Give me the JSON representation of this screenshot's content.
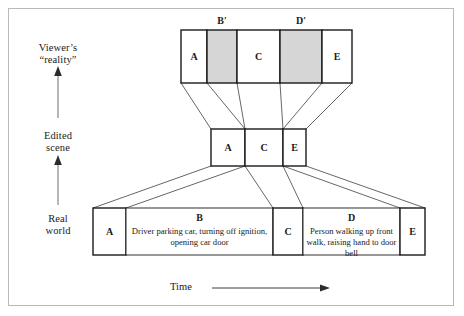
{
  "figure": {
    "background_color": "#ffffff",
    "frame_color": "#b9b9b9",
    "box_stroke": "#1a1a1a",
    "connector_stroke": "#4a4a4a",
    "shaded_fill": "#d6d6d6",
    "plain_fill": "#ffffff"
  },
  "axis": {
    "vertical": {
      "levels": [
        {
          "id": "viewers-reality",
          "line1": "Viewer’s",
          "line2": "“reality”"
        },
        {
          "id": "edited-scene",
          "line1": "Edited",
          "line2": "scene"
        },
        {
          "id": "real-world",
          "line1": "Real",
          "line2": "world"
        }
      ],
      "arrow_direction": "up",
      "arrow_count": 2
    },
    "horizontal": {
      "label": "Time",
      "arrow_direction": "right"
    }
  },
  "rows": {
    "viewers_reality": {
      "name": "Viewer’s reality",
      "segments": [
        {
          "id": "vr-a",
          "label": "A",
          "top_label": "",
          "shaded": false,
          "x": 181,
          "width": 26
        },
        {
          "id": "vr-bprime",
          "label": "",
          "top_label": "B′",
          "shaded": true,
          "x": 207,
          "width": 30
        },
        {
          "id": "vr-c",
          "label": "C",
          "top_label": "",
          "shaded": false,
          "x": 237,
          "width": 43
        },
        {
          "id": "vr-dprime",
          "label": "",
          "top_label": "D′",
          "shaded": true,
          "x": 280,
          "width": 42
        },
        {
          "id": "vr-e",
          "label": "E",
          "top_label": "",
          "shaded": false,
          "x": 322,
          "width": 30
        }
      ]
    },
    "edited_scene": {
      "name": "Edited scene",
      "segments": [
        {
          "id": "es-a",
          "label": "A",
          "shaded": false,
          "x": 211,
          "width": 34
        },
        {
          "id": "es-c",
          "label": "C",
          "shaded": false,
          "x": 245,
          "width": 38
        },
        {
          "id": "es-e",
          "label": "E",
          "shaded": false,
          "x": 283,
          "width": 23
        }
      ]
    },
    "real_world": {
      "name": "Real world",
      "segments": [
        {
          "id": "rw-a",
          "label": "A",
          "title": "",
          "desc": "",
          "x": 93,
          "width": 33
        },
        {
          "id": "rw-b",
          "label": "",
          "title": "B",
          "desc": "Driver parking car, turning off ignition, opening car door",
          "x": 126,
          "width": 147
        },
        {
          "id": "rw-c",
          "label": "C",
          "title": "",
          "desc": "",
          "x": 273,
          "width": 30
        },
        {
          "id": "rw-d",
          "label": "",
          "title": "D",
          "desc": "Person walking up front walk, raising hand to door bell",
          "x": 303,
          "width": 97
        },
        {
          "id": "rw-e",
          "label": "E",
          "title": "",
          "desc": "",
          "x": 400,
          "width": 25
        }
      ]
    }
  }
}
